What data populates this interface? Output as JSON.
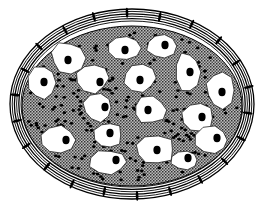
{
  "figure": {
    "colors": {
      "background": "#ffffff",
      "ink": "#000000",
      "matrix": "#8a8a8a",
      "cell": "#ffffff"
    },
    "capsule": {
      "cx": 132,
      "cy": 104,
      "rx": 122,
      "ry": 95,
      "layers": 6
    },
    "matrix": {
      "cx": 132,
      "cy": 106,
      "rx": 110,
      "ry": 80
    },
    "cells": [
      {
        "x": 68,
        "y": 58,
        "rx": 17,
        "ry": 16,
        "nx": 68,
        "ny": 60
      },
      {
        "x": 124,
        "y": 48,
        "rx": 18,
        "ry": 13,
        "nx": 125,
        "ny": 50
      },
      {
        "x": 162,
        "y": 46,
        "rx": 16,
        "ry": 13,
        "nx": 165,
        "ny": 45
      },
      {
        "x": 42,
        "y": 83,
        "rx": 14,
        "ry": 17,
        "nx": 44,
        "ny": 82
      },
      {
        "x": 92,
        "y": 78,
        "rx": 17,
        "ry": 15,
        "nx": 100,
        "ny": 82
      },
      {
        "x": 140,
        "y": 78,
        "rx": 16,
        "ry": 14,
        "nx": 140,
        "ny": 80
      },
      {
        "x": 188,
        "y": 72,
        "rx": 12,
        "ry": 20,
        "nx": 190,
        "ny": 72
      },
      {
        "x": 220,
        "y": 90,
        "rx": 14,
        "ry": 18,
        "nx": 222,
        "ny": 92
      },
      {
        "x": 98,
        "y": 108,
        "rx": 15,
        "ry": 14,
        "nx": 105,
        "ny": 107
      },
      {
        "x": 150,
        "y": 110,
        "rx": 17,
        "ry": 14,
        "nx": 148,
        "ny": 110
      },
      {
        "x": 198,
        "y": 118,
        "rx": 16,
        "ry": 15,
        "nx": 202,
        "ny": 117
      },
      {
        "x": 58,
        "y": 140,
        "rx": 19,
        "ry": 15,
        "nx": 66,
        "ny": 140
      },
      {
        "x": 108,
        "y": 135,
        "rx": 14,
        "ry": 13,
        "nx": 110,
        "ny": 133
      },
      {
        "x": 155,
        "y": 150,
        "rx": 20,
        "ry": 15,
        "nx": 157,
        "ny": 150
      },
      {
        "x": 212,
        "y": 140,
        "rx": 17,
        "ry": 14,
        "nx": 217,
        "ny": 138
      },
      {
        "x": 108,
        "y": 162,
        "rx": 18,
        "ry": 12,
        "nx": 116,
        "ny": 160
      },
      {
        "x": 185,
        "y": 160,
        "rx": 14,
        "ry": 10,
        "nx": 188,
        "ny": 158
      }
    ]
  }
}
